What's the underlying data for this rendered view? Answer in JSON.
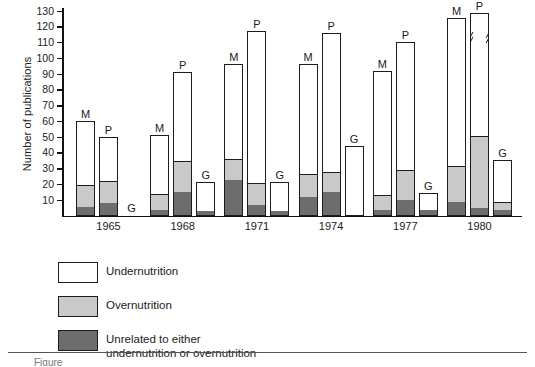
{
  "chart_data": {
    "type": "bar",
    "subtype": "grouped-stacked",
    "title": "",
    "xlabel": "",
    "ylabel": "Number of publications",
    "ylim": [
      0,
      130
    ],
    "ytick_step": 10,
    "yticks": [
      10,
      20,
      30,
      40,
      50,
      60,
      70,
      80,
      90,
      100,
      110,
      120,
      130
    ],
    "grid": false,
    "legend_position": "below-plot",
    "categories": [
      "1965",
      "1968",
      "1971",
      "1974",
      "1977",
      "1980"
    ],
    "group_labels": [
      "M",
      "P",
      "G"
    ],
    "stack_order": [
      "Unrelated to either undernutrition or overnutrition",
      "Overnutrition",
      "Undernutrition"
    ],
    "series": [
      {
        "name": "Unrelated to either undernutrition or overnutrition",
        "key": "unrelated",
        "color": "#6d6d6d",
        "values": {
          "M": [
            5,
            3,
            22,
            11,
            3,
            8
          ],
          "P": [
            7,
            14,
            6,
            14,
            9,
            4
          ],
          "G": [
            0,
            2,
            2,
            0,
            3,
            3
          ]
        }
      },
      {
        "name": "Overnutrition",
        "key": "overnutrition",
        "color": "#c9c9c9",
        "values": {
          "M": [
            14,
            10,
            13.5,
            15,
            9.5,
            23
          ],
          "P": [
            14,
            20,
            14,
            13,
            19.5,
            46
          ],
          "G": [
            0,
            0,
            0,
            0,
            0,
            5
          ]
        }
      },
      {
        "name": "Undernutrition",
        "key": "undernutrition",
        "color": "#ffffff",
        "values": {
          "M": [
            41,
            38,
            60.5,
            70,
            79,
            94
          ],
          "P": [
            29,
            57,
            97,
            89,
            81.5,
            80
          ],
          "G": [
            0,
            19,
            19,
            44,
            11,
            27
          ]
        }
      }
    ],
    "totals": {
      "M": [
        60,
        51,
        96,
        96,
        91.5,
        125
      ],
      "P": [
        50,
        91,
        117,
        116,
        110,
        130
      ],
      "G": [
        0,
        21,
        21,
        44,
        14,
        35
      ]
    },
    "annotations": [
      {
        "text": "axis-break on 1980 P bar (value exceeds 130)",
        "bar": "1980-P"
      },
      {
        "text": "1965 G bar has no publications (zero)",
        "bar": "1965-G"
      }
    ]
  },
  "axis": {
    "ylabel": "Number of publications",
    "ticks": [
      "130",
      "120",
      "110",
      "100",
      "90",
      "80",
      "70",
      "60",
      "50",
      "40",
      "30",
      "20",
      "10"
    ],
    "xticks": [
      "1965",
      "1968",
      "1971",
      "1974",
      "1977",
      "1980"
    ]
  },
  "bar_letters": {
    "m": "M",
    "p": "P",
    "g": "G"
  },
  "legend": {
    "items": [
      {
        "swatch": "white",
        "line1": "Undernutrition",
        "line2": ""
      },
      {
        "swatch": "light",
        "line1": "Overnutrition",
        "line2": ""
      },
      {
        "swatch": "dark",
        "line1": "Unrelated to either",
        "line2": "undernutrition or overnutrition"
      }
    ]
  },
  "caption": {
    "text": "Figure"
  },
  "colors": {
    "undernutrition": "#ffffff",
    "overnutrition": "#c9c9c9",
    "unrelated": "#6d6d6d",
    "outline": "#1d1d1d"
  }
}
